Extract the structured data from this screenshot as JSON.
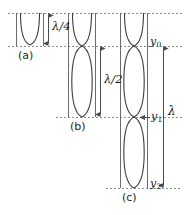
{
  "figure": {
    "type": "physics-diagram",
    "background_color": "#ffffff",
    "curve_color": "#3c3c3c",
    "dash_color": "#8c8c8c",
    "arrow_color": "#4a4a4a"
  },
  "panels": [
    {
      "tag": "(a)",
      "mode": 1,
      "antinodes": 1,
      "measure_label": "λ/4",
      "measure_value": "lambda/4",
      "box": {
        "x": 16,
        "y": 13,
        "w": 28,
        "h": 33
      }
    },
    {
      "tag": "(b)",
      "mode": 2,
      "antinodes": 2,
      "measure_label": "λ/2",
      "measure_value": "lambda/2",
      "box": {
        "x": 68,
        "y": 13,
        "w": 28,
        "h": 104
      }
    },
    {
      "tag": "(c)",
      "mode": 3,
      "antinodes": 3,
      "measure_label": "λ",
      "measure_value": "lambda",
      "box": {
        "x": 120,
        "y": 13,
        "w": 28,
        "h": 175
      }
    }
  ],
  "measures": {
    "quarter": {
      "label": "λ/4",
      "lam": "λ",
      "frac": "/4"
    },
    "half": {
      "label": "λ/2",
      "lam": "λ",
      "frac": "/2"
    },
    "full": {
      "label": "λ",
      "lam": "λ",
      "frac": ""
    }
  },
  "node_labels": [
    {
      "name": "y0",
      "text": "y",
      "sub": "0",
      "y": 46
    },
    {
      "name": "y1",
      "text": "y",
      "sub": "1",
      "y": 117
    },
    {
      "name": "y2",
      "text": "y",
      "sub": "2",
      "y": 188
    }
  ],
  "dashed_lines": [
    {
      "name": "top-reference-line",
      "y": 13,
      "x1": 8,
      "x2": 182
    },
    {
      "name": "y0-reference-line",
      "y": 46,
      "x1": 8,
      "x2": 182
    },
    {
      "name": "y1-reference-line",
      "y": 117,
      "x1": 56,
      "x2": 182
    },
    {
      "name": "y2-reference-line",
      "y": 188,
      "x1": 106,
      "x2": 182
    }
  ],
  "panel_tags": {
    "a": "(a)",
    "b": "(b)",
    "c": "(c)"
  }
}
